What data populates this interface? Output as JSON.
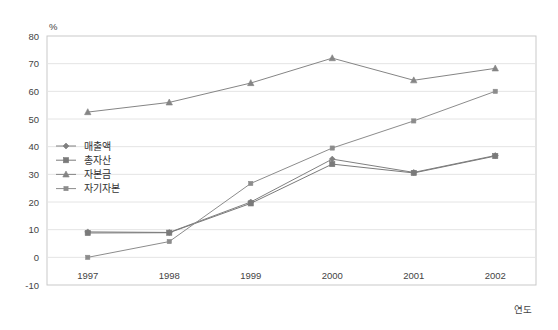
{
  "chart_data": {
    "type": "line",
    "title": "",
    "xlabel": "연도",
    "ylabel": "%",
    "x": [
      "1997",
      "1998",
      "1999",
      "2000",
      "2001",
      "2002"
    ],
    "categories": [
      "1997",
      "1998",
      "1999",
      "2000",
      "2001",
      "2002"
    ],
    "ylim": [
      -10,
      80
    ],
    "yticks": [
      "80",
      "70",
      "60",
      "50",
      "40",
      "30",
      "20",
      "10",
      "0",
      "-10"
    ],
    "ytick_values": [
      80,
      70,
      60,
      50,
      40,
      30,
      20,
      10,
      0,
      -10
    ],
    "grid": true,
    "legend_position": "inside-left",
    "series": [
      {
        "name": "매출액",
        "marker": "diamond",
        "color": "#808080",
        "values": [
          9.2,
          9.0,
          20.0,
          35.5,
          30.7,
          36.8
        ]
      },
      {
        "name": "총자산",
        "marker": "square",
        "color": "#7a7a7a",
        "values": [
          8.8,
          8.9,
          19.5,
          33.7,
          30.5,
          36.6
        ]
      },
      {
        "name": "자본금",
        "marker": "triangle",
        "color": "#858585",
        "values": [
          52.5,
          56.0,
          63.0,
          72.0,
          64.0,
          68.3
        ]
      },
      {
        "name": "자기자본",
        "marker": "small-square",
        "color": "#8c8c8c",
        "values": [
          0.0,
          5.7,
          26.7,
          39.5,
          49.3,
          60.0
        ]
      }
    ]
  },
  "axes": {
    "y_unit_label": "%",
    "x_axis_label": "연도"
  },
  "colors": {
    "plot_border": "#c9c9c9",
    "gridline": "#e4e4e4",
    "line": "#8a8a8a",
    "text": "#3a3a3a"
  }
}
